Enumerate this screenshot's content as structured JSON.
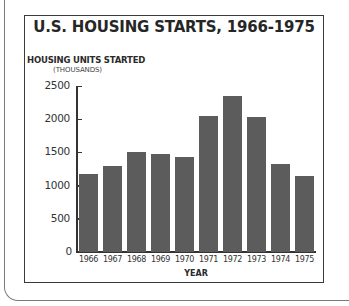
{
  "chart_data": {
    "type": "bar",
    "title": "U.S. HOUSING STARTS, 1966-1975",
    "ylabel": "HOUSING UNITS STARTED",
    "ylabel_sub": "(THOUSANDS)",
    "xlabel": "YEAR",
    "categories": [
      "1966",
      "1967",
      "1968",
      "1969",
      "1970",
      "1971",
      "1972",
      "1973",
      "1974",
      "1975"
    ],
    "values": [
      1170,
      1290,
      1510,
      1470,
      1430,
      2050,
      2350,
      2040,
      1320,
      1150
    ],
    "yticks": [
      "0",
      "500",
      "1000",
      "1500",
      "2000",
      "2500"
    ],
    "ylim": [
      0,
      2500
    ],
    "grid": false,
    "legend": null,
    "bar_color": "#5c5c5c"
  }
}
